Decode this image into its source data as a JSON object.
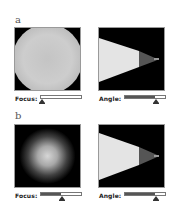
{
  "figures": [
    {
      "label": "a",
      "focus": {
        "label": "Focus:",
        "value": 0.0
      },
      "angle": {
        "label": "Angle:",
        "value": 0.75
      },
      "focus_view": "sharp-disc",
      "angle_view": "cone"
    },
    {
      "label": "b",
      "focus": {
        "label": "Focus:",
        "value": 0.5
      },
      "angle": {
        "label": "Angle:",
        "value": 0.75
      },
      "focus_view": "blurred-disc",
      "angle_view": "cone"
    }
  ],
  "colors": {
    "panel_bg": "#000000",
    "disc_light": "#d8d8d8",
    "cone_light": "#e6e6e6",
    "cone_dark": "#555555",
    "slider_fill": "#555555"
  }
}
